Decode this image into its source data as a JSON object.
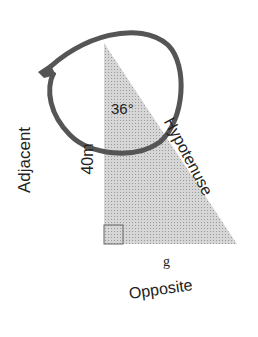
{
  "diagram": {
    "type": "right-triangle",
    "angle_label": "36°",
    "adjacent_label": "Adjacent",
    "adjacent_length": "40m",
    "hypotenuse_label": "Hypotenuse",
    "opposite_label": "Opposite",
    "opposite_value": "g",
    "colors": {
      "fill": "#c8c8c8",
      "circle_stroke": "#555555",
      "text": "#222222"
    }
  }
}
